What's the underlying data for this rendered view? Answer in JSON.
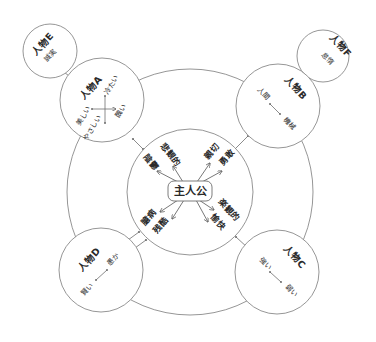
{
  "center": {
    "label": "主人公"
  },
  "traits": [
    {
      "label": "悲観的",
      "position": "upper-left-outer"
    },
    {
      "label": "陰鬱",
      "position": "upper-left-inner"
    },
    {
      "label": "親切",
      "position": "upper-right-outer"
    },
    {
      "label": "勇敢",
      "position": "upper-right-inner"
    },
    {
      "label": "臆病",
      "position": "lower-left-outer"
    },
    {
      "label": "残酷",
      "position": "lower-left-inner"
    },
    {
      "label": "楽観的",
      "position": "lower-right-outer"
    },
    {
      "label": "愉快",
      "position": "lower-right-inner"
    }
  ],
  "characters": {
    "a": {
      "name": "人物A",
      "axes": [
        "美しい",
        "醜い",
        "冷たい",
        "やさしい"
      ]
    },
    "b": {
      "name": "人物B",
      "axes": [
        "人間",
        "機械"
      ]
    },
    "c": {
      "name": "人物C",
      "axes": [
        "強い",
        "弱い"
      ]
    },
    "d": {
      "name": "人物D",
      "axes": [
        "賢い",
        "愚か"
      ]
    },
    "e": {
      "name": "人物E",
      "trait": "誠実"
    },
    "f": {
      "name": "人物F",
      "trait": "怠惰"
    }
  },
  "colors": {
    "stroke": "#8a8a8a",
    "text": "#2a2a2a",
    "background": "#ffffff"
  }
}
